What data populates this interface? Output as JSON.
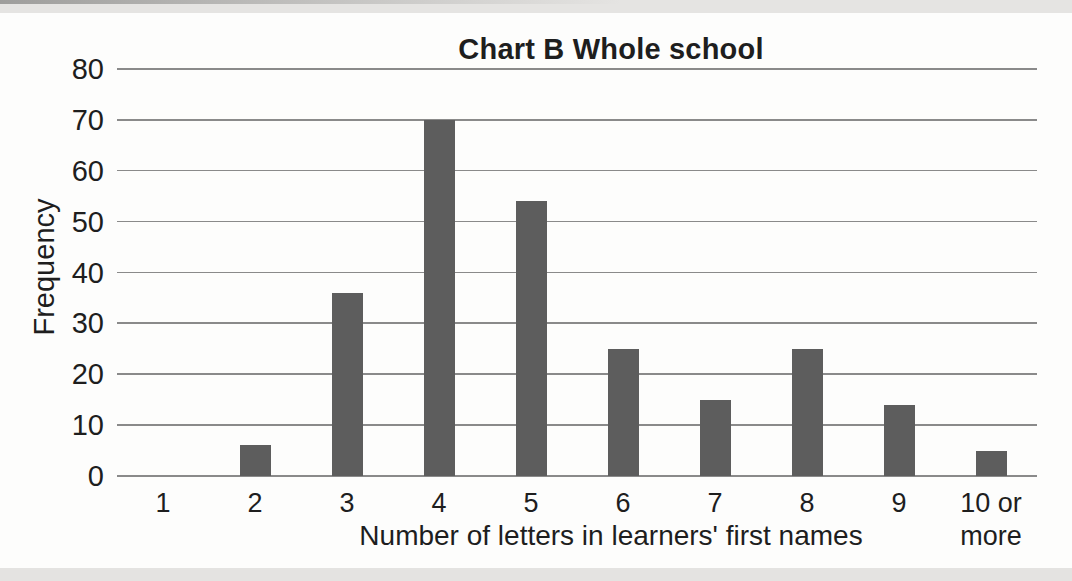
{
  "page": {
    "background_color": "#fdfdfc",
    "top_strip_color": "#e5e4e2",
    "bottom_strip_color": "#e4e3e1",
    "text_color": "#1e1e1e"
  },
  "chart_data": {
    "type": "bar",
    "title": "Chart B Whole school",
    "xlabel": "Number of letters in learners' first names",
    "ylabel": "Frequency",
    "categories": [
      "1",
      "2",
      "3",
      "4",
      "5",
      "6",
      "7",
      "8",
      "9",
      "10 or more"
    ],
    "values": [
      0,
      6,
      36,
      70,
      54,
      25,
      15,
      25,
      14,
      5
    ],
    "ylim": [
      0,
      80
    ],
    "yticks": [
      0,
      10,
      20,
      30,
      40,
      50,
      60,
      70,
      80
    ],
    "grid": true,
    "legend": false,
    "bar_color": "#5d5d5d",
    "gridline_color": "#8a8a8a"
  }
}
